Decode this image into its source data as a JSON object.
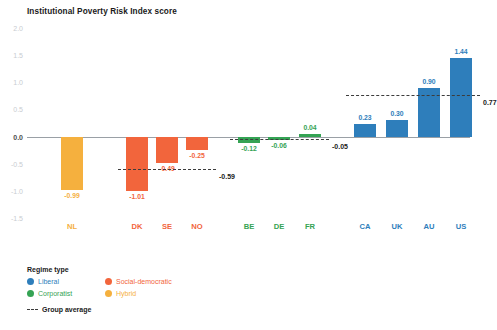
{
  "chart_data": {
    "type": "bar",
    "title": "Institutional Poverty Risk Index score",
    "xlabel": "",
    "ylabel": "",
    "ylim": [
      -1.5,
      2.0
    ],
    "yticks": [
      "2.0",
      "1.5",
      "1.0",
      "0.5",
      "0.0",
      "-0.5",
      "-1.0",
      "-1.5"
    ],
    "grid": false,
    "legend_position": "below-left",
    "categories": [
      "NL",
      "DK",
      "SE",
      "NO",
      "BE",
      "DE",
      "FR",
      "CA",
      "UK",
      "AU",
      "US"
    ],
    "values": [
      -0.99,
      -1.01,
      -0.49,
      -0.25,
      -0.12,
      -0.06,
      0.04,
      0.23,
      0.3,
      0.9,
      1.44
    ],
    "value_labels": [
      "-0.99",
      "-1.01",
      "-0.49",
      "-0.25",
      "-0.12",
      "-0.06",
      "0.04",
      "0.23",
      "0.30",
      "0.90",
      "1.44"
    ],
    "regimes": [
      "Hybrid",
      "Social-democratic",
      "Social-democratic",
      "Social-democratic",
      "Corporatist",
      "Corporatist",
      "Corporatist",
      "Liberal",
      "Liberal",
      "Liberal",
      "Liberal"
    ],
    "group_averages": [
      {
        "regime": "Social-democratic",
        "value": -0.59,
        "label": "-0.59",
        "from": "DK",
        "to": "NO"
      },
      {
        "regime": "Corporatist",
        "value": -0.05,
        "label": "-0.05",
        "from": "BE",
        "to": "FR"
      },
      {
        "regime": "Liberal",
        "value": 0.77,
        "label": "0.77",
        "from": "CA",
        "to": "US"
      }
    ],
    "colors": {
      "Liberal": "#2E7EBB",
      "Social-democratic": "#F2653C",
      "Corporatist": "#35A354",
      "Hybrid": "#F5B03E",
      "zero_axis": "#9aa0a6",
      "average_line": "#3c3c3c",
      "tick_text": "#c9ccd1"
    }
  },
  "legend": {
    "title": "Regime type",
    "items": [
      {
        "label": "Liberal",
        "color": "#2E7EBB"
      },
      {
        "label": "Social-democratic",
        "color": "#F2653C"
      },
      {
        "label": "Corporatist",
        "color": "#35A354"
      },
      {
        "label": "Hybrid",
        "color": "#F5B03E"
      }
    ],
    "average_label": "Group average"
  }
}
